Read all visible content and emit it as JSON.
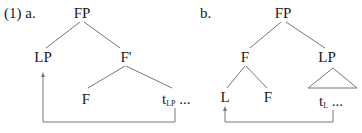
{
  "example_number": "(1)",
  "tree_a": {
    "label": "a.",
    "root": "FP",
    "left_child": "LP",
    "right_child": "F'",
    "right_left": "F",
    "trace_base": "t",
    "trace_sub": "LP",
    "trace_tail": " ..."
  },
  "tree_b": {
    "label": "b.",
    "root": "FP",
    "left_child": "F",
    "right_child": "LP",
    "left_left": "L",
    "left_right": "F",
    "trace_base": "t",
    "trace_sub": "L",
    "trace_tail": " ..."
  },
  "colors": {
    "line": "#777777",
    "text": "#1a1a1a"
  }
}
